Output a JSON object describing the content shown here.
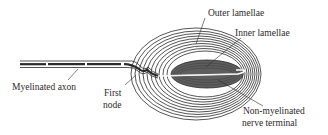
{
  "diagram": {
    "labels": {
      "outer_lamellae": "Outer lamellae",
      "inner_lamellae": "Inner lamellae",
      "myelinated_axon": "Myelinated axon",
      "first_node_line1": "First",
      "first_node_line2": "node",
      "terminal_line1": "Non-myelinated",
      "terminal_line2": "nerve terminal"
    },
    "colors": {
      "line": "#2a2a2a",
      "inner_core": "#6a6a6a",
      "background": "#ffffff"
    }
  }
}
